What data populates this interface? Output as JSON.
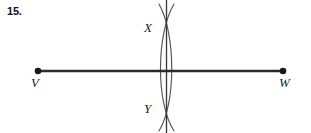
{
  "problem": {
    "number_label": "15."
  },
  "figure": {
    "type": "perpendicular-bisector-construction",
    "background_color": "#ffffff",
    "stroke_color": "#2b2b2b",
    "arc_color": "#555555",
    "segment": {
      "name": "VW",
      "start_label": "V",
      "end_label": "W",
      "start_point": {
        "x": 38,
        "y": 71
      },
      "end_point": {
        "x": 283,
        "y": 71
      },
      "stroke_width": 2.6,
      "endpoint_dot_radius": 3.2
    },
    "arcs": [
      {
        "name": "left-compass-arc",
        "center_side": "left",
        "bulges": "right",
        "path": "M 159 4 C 176 34, 176 104, 159 131"
      },
      {
        "name": "right-compass-arc",
        "center_side": "right",
        "bulges": "left",
        "path": "M 174 4 C 156 34, 156 104, 174 131"
      }
    ],
    "bisector_line": {
      "name": "perpendicular-bisector",
      "x": 166.5,
      "y_top": 0,
      "y_bottom": 133,
      "stroke_width": 1.3
    },
    "intersections": [
      {
        "label": "X",
        "x": 166.5,
        "y": 30,
        "position": "top"
      },
      {
        "label": "Y",
        "x": 166.5,
        "y": 110,
        "position": "bottom"
      }
    ],
    "labels": {
      "V": "V",
      "W": "W",
      "X": "X",
      "Y": "Y"
    }
  }
}
